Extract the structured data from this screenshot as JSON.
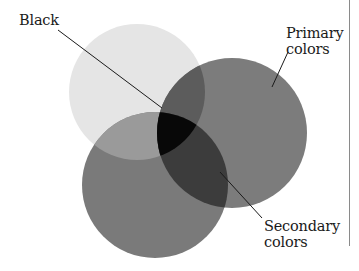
{
  "labels": {
    "black": "Black",
    "primary_line1": "Primary",
    "primary_line2": "colors",
    "secondary_line1": "Secondary",
    "secondary_line2": "colors"
  },
  "circles": [
    {
      "name": "top-left-circle",
      "cx": 137,
      "cy": 92,
      "r": 68,
      "fill": "#e5e5e5"
    },
    {
      "name": "right-circle",
      "cx": 232,
      "cy": 133,
      "r": 75,
      "fill": "#7c7c7c"
    },
    {
      "name": "bottom-circle",
      "cx": 155,
      "cy": 185,
      "r": 73,
      "fill": "#7a7a7a"
    }
  ],
  "colors": {
    "overlap_light_right": "#5c5c5c",
    "overlap_light_bottom": "#9a9a9a",
    "overlap_right_bottom": "#3c3c3c",
    "center_black": "#080808",
    "leader_line": "#1a1a1a",
    "frame_line": "#8a8a8a"
  }
}
